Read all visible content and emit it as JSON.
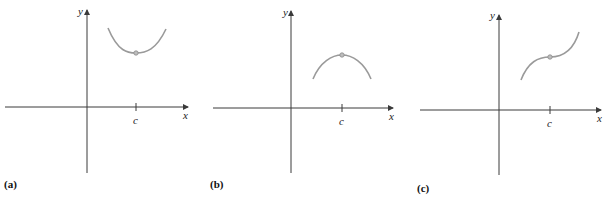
{
  "figure": {
    "panels": [
      {
        "id": "a",
        "label": "(a)",
        "y_axis_label": "y",
        "x_axis_label": "x",
        "tick_label": "c",
        "description": "relative minimum at c (concave up)"
      },
      {
        "id": "b",
        "label": "(b)",
        "y_axis_label": "y",
        "x_axis_label": "x",
        "tick_label": "c",
        "description": "relative maximum at c (concave down)"
      },
      {
        "id": "c",
        "label": "(c)",
        "y_axis_label": "y",
        "x_axis_label": "x",
        "tick_label": "c",
        "description": "increasing with horizontal tangent (inflection) at c"
      }
    ],
    "colors": {
      "axis": "#3a3a3a",
      "curve": "#9a9a9a",
      "point": "#bdbdbd"
    }
  }
}
